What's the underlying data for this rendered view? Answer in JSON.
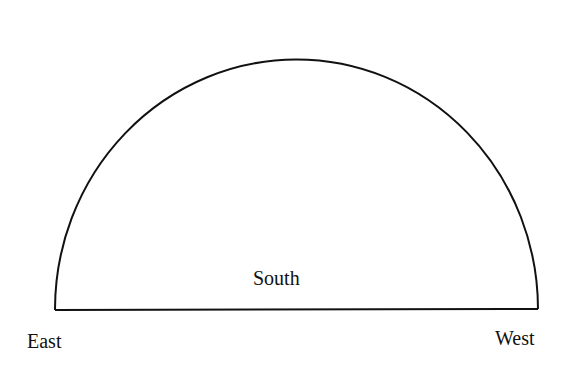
{
  "diagram": {
    "type": "semicircle-sky-dome",
    "shape": {
      "baseline_left": [
        55,
        310
      ],
      "baseline_right": [
        538,
        309
      ],
      "apex": [
        296,
        60
      ],
      "stroke_color": "#111111",
      "stroke_width": 2
    },
    "labels": {
      "east": "East",
      "west": "West",
      "south": "South"
    }
  }
}
